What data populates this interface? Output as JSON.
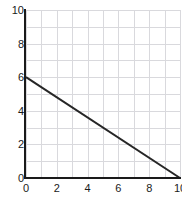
{
  "chart_data": {
    "type": "line",
    "title": "",
    "subtitle": "",
    "xlabel": "",
    "ylabel": "",
    "xlim": [
      0,
      10
    ],
    "ylim": [
      0,
      10
    ],
    "x_ticks": [
      0,
      2,
      4,
      6,
      8,
      10
    ],
    "y_ticks": [
      0,
      2,
      4,
      6,
      8,
      10
    ],
    "x_tick_labels": [
      "0",
      "2",
      "4",
      "6",
      "8",
      "10"
    ],
    "y_tick_labels": [
      "0",
      "2",
      "4",
      "6",
      "8",
      "10"
    ],
    "grid": true,
    "grid_minor_step": 1,
    "grid_color": "#d9d9dd",
    "axis_color": "#1a1a1a",
    "legend": null,
    "annotations": [],
    "series": [
      {
        "name": "line",
        "color": "#262626",
        "line_width": 2,
        "equation": "y = 6 - 0.6x",
        "x": [
          0,
          10
        ],
        "values": [
          6,
          0
        ],
        "points": [
          [
            0,
            6
          ],
          [
            10,
            0
          ]
        ]
      }
    ]
  }
}
